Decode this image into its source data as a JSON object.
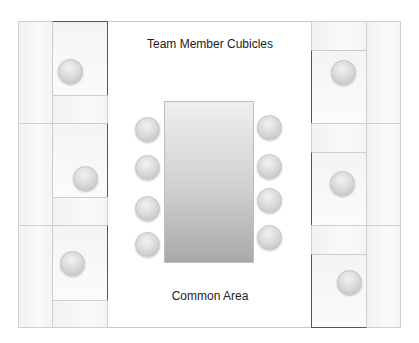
{
  "diagram": {
    "type": "office-floor-plan",
    "labels": {
      "top": "Team Member Cubicles",
      "bottom": "Common Area"
    },
    "colors": {
      "frame_border": "#c9c9c9",
      "cubicle_fill": "#f6f6f6",
      "cubicle_accent_border": "#555555",
      "chair_fill": "#d6d6d6",
      "table_top": "#efefef",
      "table_bottom": "#a9a9a9"
    },
    "left_cubicles": [
      {
        "id": "L1",
        "chair": true
      },
      {
        "id": "L2",
        "chair": true
      },
      {
        "id": "L3",
        "chair": true
      }
    ],
    "right_cubicles": [
      {
        "id": "R1",
        "chair": true
      },
      {
        "id": "R2",
        "chair": true
      },
      {
        "id": "R3",
        "chair": true
      }
    ],
    "conference_table": {
      "shape": "rectangle",
      "chairs_left": 4,
      "chairs_right": 4
    }
  }
}
